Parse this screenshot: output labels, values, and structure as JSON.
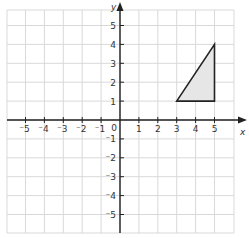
{
  "diagram": {
    "type": "coordinate-plane",
    "x_axis": {
      "label": "x",
      "min": -5,
      "max": 5,
      "tick_labels": [
        "⁻5",
        "⁻4",
        "⁻3",
        "⁻2",
        "⁻1",
        "0",
        "1",
        "2",
        "3",
        "4",
        "5"
      ]
    },
    "y_axis": {
      "label": "y",
      "min": -5,
      "max": 5,
      "tick_labels_positive": [
        "1",
        "2",
        "3",
        "4",
        "5"
      ],
      "tick_labels_negative": [
        "⁻1",
        "⁻2",
        "⁻3",
        "⁻4",
        "⁻5"
      ]
    },
    "origin_label": "0",
    "grid": {
      "visible": true,
      "color": "#d9d9d9"
    },
    "shapes": [
      {
        "name": "triangle",
        "vertices": [
          [
            3,
            1
          ],
          [
            5,
            1
          ],
          [
            5,
            4
          ]
        ],
        "fill": "#e6e6e6",
        "stroke": "#222222"
      }
    ],
    "colors": {
      "axis": "#222222",
      "grid": "#d9d9d9",
      "label": "#333333",
      "shape_fill": "#e6e6e6"
    }
  }
}
